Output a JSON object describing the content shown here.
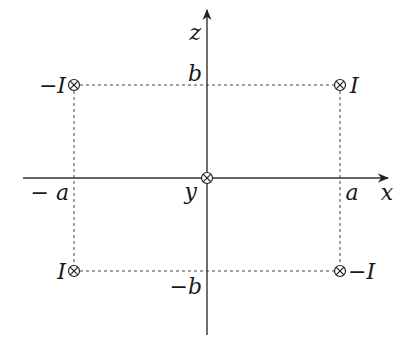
{
  "diagram": {
    "axes": {
      "horizontal": {
        "label": "x",
        "pos_tick": "a",
        "neg_tick": "− a"
      },
      "vertical": {
        "label": "z",
        "pos_tick": "b",
        "neg_tick": "−b"
      },
      "origin_label": "y"
    },
    "currents": [
      {
        "id": "top-left",
        "label": "−I",
        "symbol": "into-page",
        "position": "(-a, b)"
      },
      {
        "id": "top-right",
        "label": "I",
        "symbol": "into-page",
        "position": "(a, b)"
      },
      {
        "id": "bottom-left",
        "label": "I",
        "symbol": "into-page",
        "position": "(-a, -b)"
      },
      {
        "id": "bottom-right",
        "label": "−I",
        "symbol": "into-page",
        "position": "(a, -b)"
      }
    ],
    "origin_symbol": "into-page",
    "colors": {
      "ink": "#222222",
      "background": "#ffffff"
    }
  }
}
